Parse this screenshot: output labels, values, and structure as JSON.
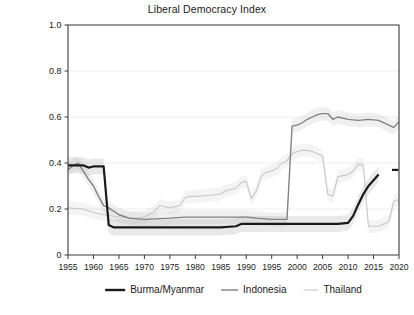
{
  "chart": {
    "title": "Liberal Democracy Index",
    "type": "line"
  },
  "axes": {
    "y_ticks": [
      "1.0",
      "0.8",
      "0.6",
      "0.4",
      "0.2",
      "0"
    ],
    "x_ticks": [
      "1955",
      "1960",
      "1965",
      "1970",
      "1975",
      "1980",
      "1985",
      "1990",
      "1995",
      "2000",
      "2005",
      "2010",
      "2015",
      "2020"
    ]
  },
  "legend": {
    "items": [
      {
        "label": "Burma/Myanmar",
        "color": "#1a1a1a"
      },
      {
        "label": "Indonesia",
        "color": "#808080"
      },
      {
        "label": "Thailand",
        "color": "#c8c8c8"
      }
    ]
  },
  "chart_data": {
    "type": "line",
    "title": "Liberal Democracy Index",
    "xlabel": "",
    "ylabel": "",
    "xlim": [
      1955,
      2020
    ],
    "ylim": [
      0,
      1.0
    ],
    "yticks": [
      0,
      0.2,
      0.4,
      0.6,
      0.8,
      1.0
    ],
    "xticks": [
      1955,
      1960,
      1965,
      1970,
      1975,
      1980,
      1985,
      1990,
      1995,
      2000,
      2005,
      2010,
      2015,
      2020
    ],
    "grid": true,
    "legend_position": "bottom",
    "series": [
      {
        "name": "Burma/Myanmar",
        "color": "#1a1a1a",
        "x": [
          1955,
          1956,
          1957,
          1958,
          1959,
          1960,
          1961,
          1962,
          1963,
          1964,
          1965,
          1970,
          1975,
          1980,
          1985,
          1988,
          1989,
          1990,
          1995,
          2000,
          2005,
          2008,
          2010,
          2011,
          2012,
          2013,
          2014,
          2015,
          2016
        ],
        "y": [
          0.39,
          0.39,
          0.39,
          0.39,
          0.38,
          0.385,
          0.385,
          0.385,
          0.13,
          0.12,
          0.12,
          0.12,
          0.12,
          0.12,
          0.12,
          0.125,
          0.135,
          0.135,
          0.135,
          0.135,
          0.135,
          0.135,
          0.14,
          0.17,
          0.22,
          0.265,
          0.3,
          0.325,
          0.35
        ],
        "end_marker_y": 0.37
      },
      {
        "name": "Indonesia",
        "color": "#808080",
        "x": [
          1955,
          1956,
          1957,
          1958,
          1959,
          1960,
          1961,
          1962,
          1963,
          1965,
          1967,
          1970,
          1975,
          1978,
          1980,
          1985,
          1990,
          1992,
          1995,
          1998,
          1999,
          2000,
          2001,
          2002,
          2003,
          2004,
          2005,
          2006,
          2007,
          2008,
          2010,
          2012,
          2014,
          2016,
          2018,
          2019,
          2020
        ],
        "y": [
          0.37,
          0.39,
          0.4,
          0.365,
          0.33,
          0.3,
          0.255,
          0.215,
          0.205,
          0.175,
          0.16,
          0.155,
          0.16,
          0.165,
          0.165,
          0.165,
          0.165,
          0.16,
          0.155,
          0.155,
          0.56,
          0.565,
          0.575,
          0.59,
          0.6,
          0.61,
          0.615,
          0.615,
          0.59,
          0.6,
          0.59,
          0.585,
          0.59,
          0.585,
          0.565,
          0.555,
          0.58
        ]
      },
      {
        "name": "Thailand",
        "color": "#c8c8c8",
        "x": [
          1955,
          1958,
          1960,
          1962,
          1965,
          1968,
          1970,
          1972,
          1973,
          1975,
          1976,
          1977,
          1978,
          1979,
          1980,
          1983,
          1985,
          1986,
          1988,
          1989,
          1990,
          1991,
          1992,
          1993,
          1994,
          1995,
          1996,
          1997,
          1998,
          1999,
          2000,
          2001,
          2002,
          2003,
          2004,
          2005,
          2006,
          2007,
          2008,
          2009,
          2010,
          2011,
          2012,
          2013,
          2014,
          2015,
          2016,
          2018,
          2019,
          2020
        ],
        "y": [
          0.205,
          0.2,
          0.185,
          0.175,
          0.165,
          0.16,
          0.165,
          0.19,
          0.215,
          0.205,
          0.21,
          0.215,
          0.25,
          0.255,
          0.255,
          0.26,
          0.265,
          0.28,
          0.29,
          0.315,
          0.32,
          0.245,
          0.28,
          0.345,
          0.36,
          0.365,
          0.375,
          0.4,
          0.41,
          0.44,
          0.45,
          0.455,
          0.455,
          0.45,
          0.44,
          0.43,
          0.265,
          0.255,
          0.34,
          0.345,
          0.35,
          0.365,
          0.395,
          0.39,
          0.125,
          0.125,
          0.125,
          0.145,
          0.235,
          0.24
        ]
      }
    ]
  }
}
